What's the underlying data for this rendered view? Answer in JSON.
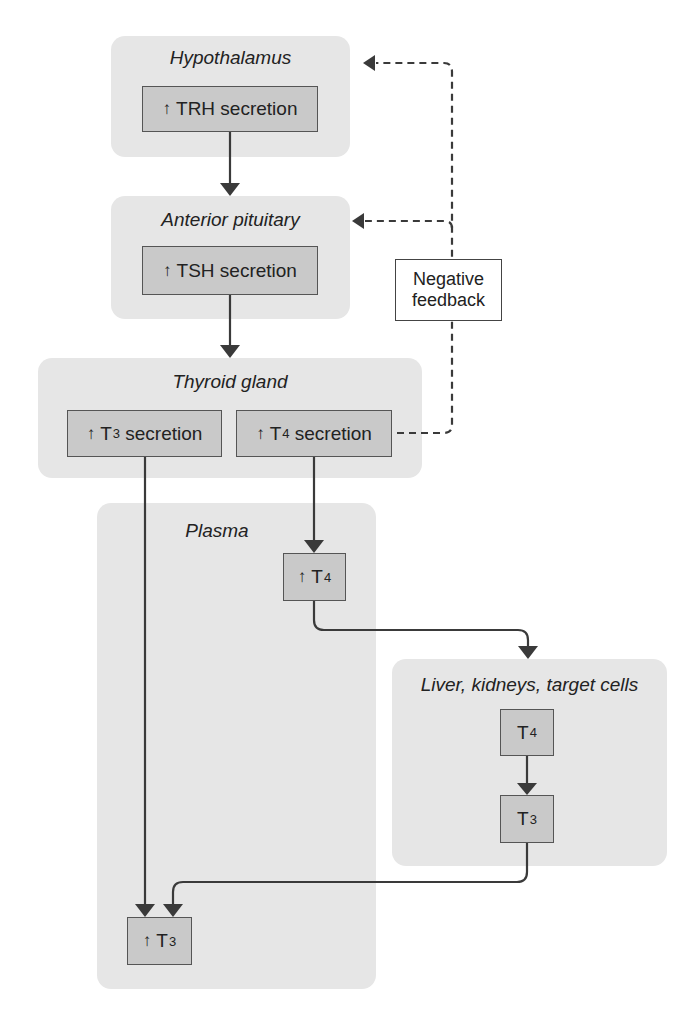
{
  "colors": {
    "panel_bg": "#e6e6e6",
    "box_bg": "#c9c9c9",
    "box_border": "#555555",
    "arrow": "#3a3a3a",
    "feedback_box_bg": "#ffffff"
  },
  "panels": {
    "hypothalamus": {
      "title": "Hypothalamus"
    },
    "anterior_pituitary": {
      "title": "Anterior pituitary"
    },
    "thyroid_gland": {
      "title": "Thyroid gland"
    },
    "plasma": {
      "title": "Plasma"
    },
    "liver": {
      "title": "Liver, kidneys, target cells"
    }
  },
  "nodes": {
    "trh": {
      "arrow": "↑",
      "label": "TRH secretion"
    },
    "tsh": {
      "arrow": "↑",
      "label": "TSH secretion"
    },
    "t3_secretion": {
      "arrow": "↑",
      "base": "T",
      "sub": "3",
      "suffix": " secretion"
    },
    "t4_secretion": {
      "arrow": "↑",
      "base": "T",
      "sub": "4",
      "suffix": " secretion"
    },
    "plasma_t4": {
      "arrow": "↑",
      "base": "T",
      "sub": "4"
    },
    "liver_t4": {
      "base": "T",
      "sub": "4"
    },
    "liver_t3": {
      "base": "T",
      "sub": "3"
    },
    "plasma_t3": {
      "arrow": "↑",
      "base": "T",
      "sub": "3"
    }
  },
  "feedback": {
    "line1": "Negative",
    "line2": "feedback"
  },
  "edges": [
    {
      "from": "TRH secretion",
      "to": "Anterior pituitary",
      "style": "solid"
    },
    {
      "from": "TSH secretion",
      "to": "Thyroid gland",
      "style": "solid"
    },
    {
      "from": "T4 secretion",
      "to": "Plasma T4",
      "style": "solid"
    },
    {
      "from": "Plasma T4",
      "to": "Liver, kidneys, target cells",
      "style": "solid"
    },
    {
      "from": "Liver T4",
      "to": "Liver T3",
      "style": "solid"
    },
    {
      "from": "Liver T3",
      "to": "Plasma T3",
      "style": "solid"
    },
    {
      "from": "T3 secretion",
      "to": "Plasma T3",
      "style": "solid"
    },
    {
      "from": "T4 secretion",
      "to": "Anterior pituitary",
      "style": "dashed",
      "label": "Negative feedback"
    },
    {
      "from": "T4 secretion",
      "to": "Hypothalamus",
      "style": "dashed",
      "label": "Negative feedback"
    }
  ]
}
